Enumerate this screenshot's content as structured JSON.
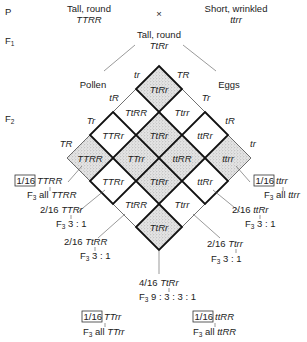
{
  "generations": {
    "p": "P",
    "f1": "F",
    "f1_sub": "1",
    "f2": "F",
    "f2_sub": "2"
  },
  "parents": {
    "left_phenotype": "Tall, round",
    "left_genotype": "TTRR",
    "cross_symbol": "×",
    "right_phenotype": "Short, wrinkled",
    "right_genotype": "ttrr"
  },
  "f1": {
    "phenotype": "Tall, round",
    "genotype": "TtRr"
  },
  "gamete_sources": {
    "left": "Pollen",
    "right": "Eggs"
  },
  "pollen_gametes": [
    "tr",
    "tR",
    "Tr",
    "TR"
  ],
  "egg_gametes": [
    "TR",
    "Tr",
    "tR",
    "tr"
  ],
  "grid": [
    [
      "TtRr",
      "Ttrr",
      "ttRr",
      "ttrr"
    ],
    [
      "TtRR",
      "TtRr",
      "ttRR",
      "ttRr"
    ],
    [
      "TTRr",
      "TTrr",
      "TtRr",
      "Ttrr"
    ],
    [
      "TTRR",
      "TTRr",
      "TtRR",
      "TtRr"
    ]
  ],
  "colors": {
    "shade": "#d9d9d9",
    "line": "#111111",
    "thin_line": "#555555"
  },
  "f3_results": {
    "TTRR": {
      "fraction": "1/16",
      "genotype": "TTRR",
      "f3": "F",
      "f3_sub": "3",
      "result": "all",
      "result_geno": "TTRR",
      "boxed": true
    },
    "ttrr": {
      "fraction": "1/16",
      "genotype": "ttrr",
      "f3": "F",
      "f3_sub": "3",
      "result": "all",
      "result_geno": "ttrr",
      "boxed": true
    },
    "TTRr": {
      "fraction": "2/16",
      "genotype": "TTRr",
      "f3": "F",
      "f3_sub": "3",
      "result": "3 : 1"
    },
    "ttRr": {
      "fraction": "2/16",
      "genotype": "ttRr",
      "f3": "F",
      "f3_sub": "3",
      "result": "3 : 1"
    },
    "TtRR": {
      "fraction": "2/16",
      "genotype": "TtRR",
      "f3": "F",
      "f3_sub": "3",
      "result": "3 : 1"
    },
    "Ttrr": {
      "fraction": "2/16",
      "genotype": "Ttrr",
      "f3": "F",
      "f3_sub": "3",
      "result": "3 : 1"
    },
    "TtRr": {
      "fraction": "4/16",
      "genotype": "TtRr",
      "f3": "F",
      "f3_sub": "3",
      "result": "9 : 3 : 3 : 1"
    },
    "TTrr": {
      "fraction": "1/16",
      "genotype": "TTrr",
      "f3": "F",
      "f3_sub": "3",
      "result": "all",
      "result_geno": "TTrr",
      "boxed": true
    },
    "ttRR": {
      "fraction": "1/16",
      "genotype": "ttRR",
      "f3": "F",
      "f3_sub": "3",
      "result": "all",
      "result_geno": "ttRR",
      "boxed": true
    }
  }
}
